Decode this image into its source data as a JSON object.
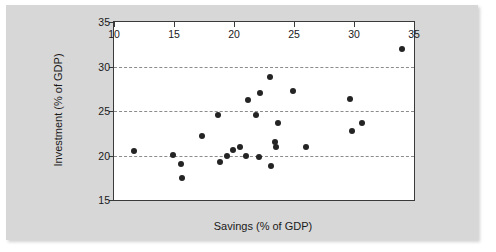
{
  "figure": {
    "background_color": "#ffffff",
    "panel_color": "#d7d7d7",
    "plot_background_color": "#ffffff",
    "frame_color": "#3a3a3a",
    "marker_color": "#242424",
    "gridline_color": "#8c8c8c"
  },
  "chart_data": {
    "type": "scatter",
    "title": "",
    "xlabel": "Savings (% of GDP)",
    "ylabel": "Investment (% of GDP)",
    "xlim": [
      10,
      35
    ],
    "ylim": [
      15,
      35
    ],
    "xticks": [
      10,
      15,
      20,
      25,
      30,
      35
    ],
    "yticks": [
      15,
      20,
      25,
      30,
      35
    ],
    "xtick_labels": [
      "10",
      "15",
      "20",
      "25",
      "30",
      "35"
    ],
    "ytick_labels": [
      "15",
      "20",
      "25",
      "30",
      "35"
    ],
    "grid": "horizontal dashed gridlines at y = 20, 25, 30",
    "gridlines_y": [
      20,
      25,
      30
    ],
    "legend": null,
    "marker": "filled circle",
    "points": [
      {
        "x": 11.7,
        "y": 20.5
      },
      {
        "x": 14.9,
        "y": 20.1
      },
      {
        "x": 15.6,
        "y": 19.1
      },
      {
        "x": 15.7,
        "y": 17.5
      },
      {
        "x": 17.3,
        "y": 22.2
      },
      {
        "x": 18.7,
        "y": 24.6
      },
      {
        "x": 18.8,
        "y": 19.3
      },
      {
        "x": 19.4,
        "y": 20.0
      },
      {
        "x": 19.9,
        "y": 20.6
      },
      {
        "x": 20.5,
        "y": 21.0
      },
      {
        "x": 21.0,
        "y": 19.9
      },
      {
        "x": 21.2,
        "y": 26.2
      },
      {
        "x": 21.8,
        "y": 24.5
      },
      {
        "x": 22.1,
        "y": 19.8
      },
      {
        "x": 22.2,
        "y": 27.0
      },
      {
        "x": 23.0,
        "y": 28.8
      },
      {
        "x": 23.1,
        "y": 18.8
      },
      {
        "x": 23.4,
        "y": 21.5
      },
      {
        "x": 23.5,
        "y": 21.0
      },
      {
        "x": 23.7,
        "y": 23.6
      },
      {
        "x": 24.9,
        "y": 27.3
      },
      {
        "x": 26.0,
        "y": 21.0
      },
      {
        "x": 29.7,
        "y": 26.4
      },
      {
        "x": 29.8,
        "y": 22.8
      },
      {
        "x": 30.7,
        "y": 23.7
      },
      {
        "x": 34.0,
        "y": 32.0
      }
    ]
  }
}
